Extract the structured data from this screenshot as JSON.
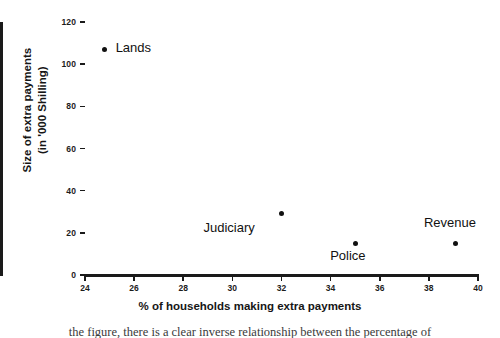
{
  "chart_data": {
    "type": "scatter",
    "title": "",
    "xlabel": "% of households making extra payments",
    "ylabel": "Size of extra payments\n(in '000 Shilling)",
    "ylabel_line1": "Size of extra payments",
    "ylabel_line2": "(in '000 Shilling)",
    "xlim": [
      24,
      40
    ],
    "ylim": [
      0,
      120
    ],
    "xticks": [
      24,
      26,
      28,
      30,
      32,
      34,
      36,
      38,
      40
    ],
    "yticks": [
      0,
      20,
      40,
      60,
      80,
      100,
      120
    ],
    "grid": false,
    "legend": "none",
    "marker": "filled-circle",
    "marker_color": "#111111",
    "axis_color": "#1a1a1a",
    "points": [
      {
        "label": "Lands",
        "x": 24.8,
        "y": 107,
        "label_pos": "right"
      },
      {
        "label": "Judiciary",
        "x": 32.0,
        "y": 29,
        "label_pos": "below-left"
      },
      {
        "label": "Police",
        "x": 35.0,
        "y": 15,
        "label_pos": "below"
      },
      {
        "label": "Revenue",
        "x": 39.1,
        "y": 15,
        "label_pos": "above"
      }
    ]
  },
  "caption": {
    "remnant": "the figure, there is a clear inverse relationship between the percentage of"
  }
}
